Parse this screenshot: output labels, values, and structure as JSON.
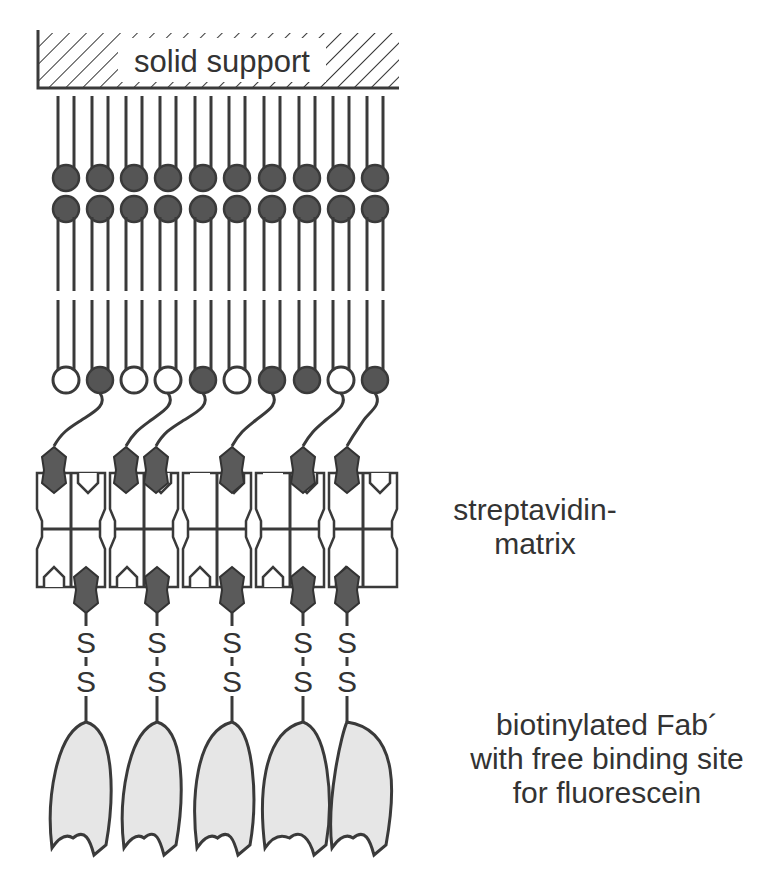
{
  "diagram": {
    "colors": {
      "line": "#3a3a3a",
      "filled_head": "#555555",
      "biotin": "#5a5a5a",
      "fab_fill": "#e6e6e6",
      "background": "#ffffff"
    },
    "solid_support": {
      "label": "solid support"
    },
    "lipid_layer": {
      "upper_head_count": 10,
      "upper_rows": 2,
      "lower_head_pattern": [
        "open",
        "filled",
        "open",
        "open",
        "filled",
        "open",
        "filled",
        "filled",
        "open",
        "filled"
      ],
      "biotinylated_lipid_positions": [
        1,
        3,
        4,
        6,
        8,
        9
      ]
    },
    "streptavidin_blocks": 5,
    "upper_biotins": 6,
    "lower_biotins": 5,
    "disulfide_label": "S",
    "fab_count": 5,
    "labels": {
      "streptavidin_line1": "streptavidin-",
      "streptavidin_line2": "matrix",
      "fab_line1": "biotinylated Fab´",
      "fab_line2": "with free binding site",
      "fab_line3": "for fluorescein"
    }
  }
}
